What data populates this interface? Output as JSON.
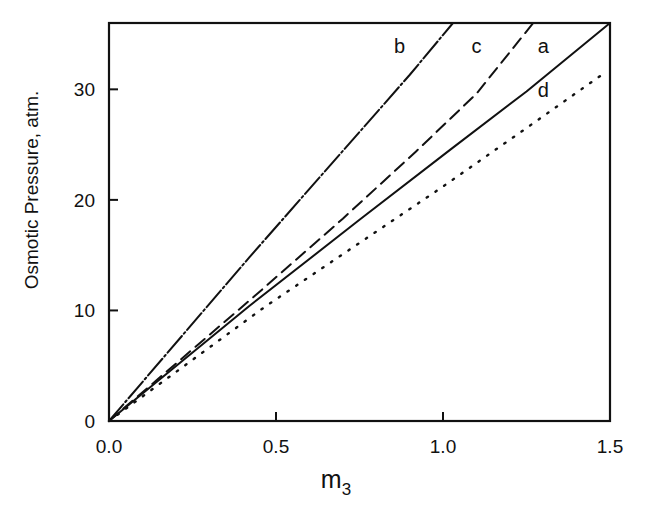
{
  "chart_data": {
    "type": "line",
    "title": "",
    "xlabel": "m",
    "xlabel_subscript": "3",
    "ylabel": "Osmotic Pressure, atm.",
    "xlim": [
      0.0,
      1.5
    ],
    "ylim": [
      0,
      36
    ],
    "grid": false,
    "legend": "inline curve labels",
    "x_ticks": [
      0.0,
      0.5,
      1.0,
      1.5
    ],
    "x_tick_labels": [
      "0.0",
      "0.5",
      "1.0",
      "1.5"
    ],
    "y_ticks": [
      0,
      10,
      20,
      30
    ],
    "y_tick_labels": [
      "0",
      "10",
      "20",
      "30"
    ],
    "series": [
      {
        "name": "a",
        "style": "solid",
        "x": [
          0.0,
          0.42,
          0.75,
          1.02,
          1.25,
          1.5
        ],
        "y": [
          0,
          10.4,
          18.2,
          24.5,
          29.8,
          36.0
        ]
      },
      {
        "name": "b",
        "style": "dash-dot",
        "x": [
          0.0,
          0.42,
          0.705,
          0.9,
          1.03
        ],
        "y": [
          0,
          14.8,
          24.6,
          31.3,
          36.0
        ]
      },
      {
        "name": "c",
        "style": "dashed",
        "x": [
          0.0,
          0.436,
          0.7,
          0.92,
          1.1,
          1.27
        ],
        "y": [
          0,
          11.3,
          18.3,
          24.4,
          29.6,
          36.0
        ]
      },
      {
        "name": "d",
        "style": "dotted",
        "x": [
          0.0,
          0.47,
          0.995,
          1.25,
          1.47
        ],
        "y": [
          0,
          10.4,
          21.1,
          26.5,
          31.2
        ]
      }
    ],
    "curve_labels": [
      {
        "text": "b",
        "x": 0.87,
        "y": 33.3
      },
      {
        "text": "c",
        "x": 1.1,
        "y": 33.3
      },
      {
        "text": "a",
        "x": 1.3,
        "y": 33.3
      },
      {
        "text": "d",
        "x": 1.3,
        "y": 29.3
      }
    ]
  }
}
